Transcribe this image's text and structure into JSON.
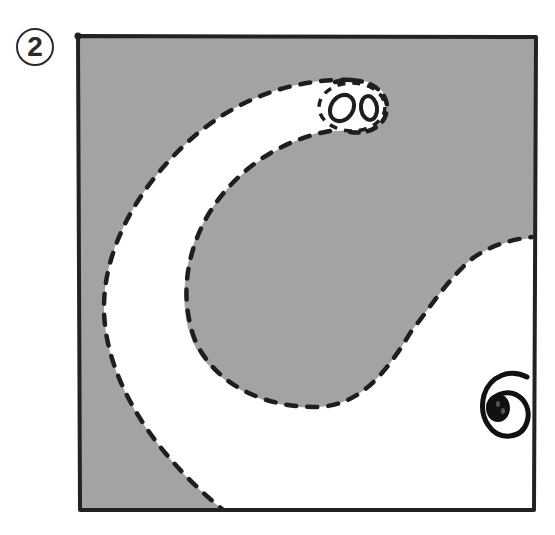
{
  "figure": {
    "step_number": "2",
    "colors": {
      "fill_gray": "#a3a3a3",
      "background": "#ffffff",
      "outline": "#222222",
      "dashed_line": "#1e1e1e"
    },
    "icons": {
      "step_badge": "circled-number-icon",
      "nostrils": "nostrils-icon",
      "eye": "spiral-eye-icon"
    }
  }
}
